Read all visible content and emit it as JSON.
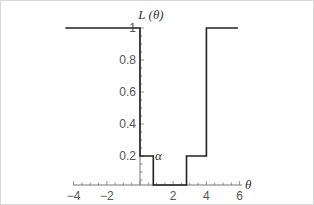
{
  "chart_data": {
    "type": "line",
    "title": "",
    "xlabel": "θ",
    "ylabel": "L (θ)",
    "annotation": "α",
    "x_ticks": [
      "-4",
      "-2",
      "2",
      "4",
      "6"
    ],
    "y_ticks": [
      "0.2",
      "0.4",
      "0.6",
      "0.8",
      "1"
    ],
    "xlim": [
      -4.5,
      6
    ],
    "ylim": [
      0,
      1
    ],
    "grid": false,
    "series": [
      {
        "name": "L(θ)",
        "step": true,
        "points": [
          {
            "x": -4.5,
            "y": 1
          },
          {
            "x": 0,
            "y": 1
          },
          {
            "x": 0,
            "y": 0.2
          },
          {
            "x": 0.8,
            "y": 0.2
          },
          {
            "x": 0.8,
            "y": 0
          },
          {
            "x": 2.8,
            "y": 0
          },
          {
            "x": 2.8,
            "y": 0.2
          },
          {
            "x": 4,
            "y": 0.2
          },
          {
            "x": 4,
            "y": 1
          },
          {
            "x": 5.9,
            "y": 1
          }
        ]
      }
    ]
  },
  "labels": {
    "y_axis_title": "L (θ)",
    "x_axis_title": "θ",
    "alpha": "α"
  }
}
